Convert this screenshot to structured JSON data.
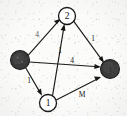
{
  "figure": {
    "type": "directed-weighted-graph",
    "caption": "",
    "background_color": "#fbfbfa",
    "ink_color": "#151515"
  },
  "graph_data": {
    "type": "diagram",
    "directed": true,
    "nodes": [
      {
        "id": "s",
        "label": "",
        "style": "filled",
        "fill": "#3a3a3a",
        "x": 20,
        "y": 60,
        "r": 9.5,
        "role": "source"
      },
      {
        "id": "v2",
        "label": "2",
        "style": "open",
        "fill": "#ffffff",
        "x": 67,
        "y": 16,
        "r": 8.5,
        "role": "intermediate"
      },
      {
        "id": "v1",
        "label": "1",
        "style": "open",
        "fill": "#ffffff",
        "x": 48,
        "y": 103,
        "r": 8.5,
        "role": "intermediate"
      },
      {
        "id": "t",
        "label": "t",
        "style": "filled",
        "fill": "#3a3a3a",
        "x": 110,
        "y": 69,
        "r": 9.5,
        "role": "sink"
      }
    ],
    "edges": [
      {
        "from": "s",
        "to": "v2",
        "label": "4",
        "label_x": 37,
        "label_y": 34,
        "faint": true
      },
      {
        "from": "v2",
        "to": "t",
        "label": "1",
        "label_x": 93,
        "label_y": 38,
        "faint": false
      },
      {
        "from": "v1",
        "to": "v2",
        "label": "1",
        "label_x": 60,
        "label_y": 50,
        "faint": false
      },
      {
        "from": "s",
        "to": "t",
        "label": "4",
        "label_x": 72,
        "label_y": 60,
        "faint": false
      },
      {
        "from": "s",
        "to": "v1",
        "label": "1",
        "label_x": 29,
        "label_y": 80,
        "faint": false
      },
      {
        "from": "v1",
        "to": "t",
        "label": "M",
        "label_x": 82,
        "label_y": 94,
        "faint": false
      }
    ]
  }
}
